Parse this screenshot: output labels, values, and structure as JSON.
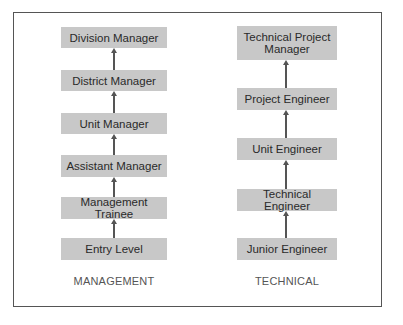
{
  "diagram": {
    "columns": [
      {
        "title": "MANAGEMENT",
        "levels_top_to_bottom": [
          "Division Manager",
          "District Manager",
          "Unit Manager",
          "Assistant Manager",
          "Management Trainee",
          "Entry Level"
        ]
      },
      {
        "title": "TECHNICAL",
        "levels_top_to_bottom": [
          "Technical Project Manager",
          "Project Engineer",
          "Unit Engineer",
          "Technical Engineer",
          "Junior Engineer"
        ]
      }
    ],
    "colors": {
      "box_fill": "#c8c8c8",
      "arrow": "#555555",
      "frame": "#555555"
    }
  }
}
